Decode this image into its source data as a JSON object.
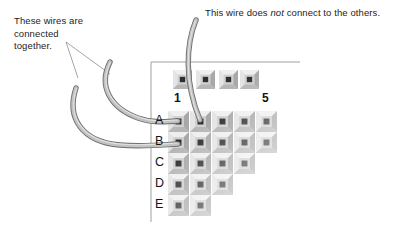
{
  "diagram": {
    "background_color": "#ffffff",
    "annotations": {
      "left": {
        "id": "left-callout",
        "text": "These wires are\nconnected\ntogether.",
        "lines": [
          "These wires are",
          "connected",
          "together."
        ],
        "color": "#1d1d1d"
      },
      "right": {
        "id": "right-callout",
        "text_before": "This wire does ",
        "emphasis": "not",
        "text_after": " connect to the others.",
        "full_text": "This wire does not connect to the others.",
        "color": "#1d1d1d"
      }
    },
    "board": {
      "name": "solderless-breadboard",
      "border_color": "#9a9a9a",
      "socket_face_color": "#d2d2d2",
      "socket_bevel_light": "#ebebeb",
      "socket_bevel_dark": "#9c9c9c",
      "socket_hole_color": "#2b2b2b",
      "bus_strip": {
        "label": "power-bus-strip",
        "socket_count": 4
      },
      "column_labels": [
        "1",
        "5"
      ],
      "column_label_positions": [
        1,
        5
      ],
      "row_labels": [
        "A",
        "B",
        "C",
        "D",
        "E"
      ],
      "row_socket_counts": [
        5,
        5,
        4,
        3,
        1
      ],
      "rows_obscured_by_wire": [
        "B"
      ]
    },
    "wires": [
      {
        "name": "wire-to-a1",
        "color": "#b4b4b4",
        "outline_color": "#6e6e6e",
        "connects_to": "A1",
        "group": "connected-together"
      },
      {
        "name": "wire-to-b1",
        "color": "#b4b4b4",
        "outline_color": "#6e6e6e",
        "connects_to": "B1",
        "group": "connected-together"
      },
      {
        "name": "wire-to-a2-isolated",
        "color": "#b4b4b4",
        "outline_color": "#6e6e6e",
        "connects_to": "A2",
        "group": "not-connected"
      }
    ],
    "leader_lines": {
      "name": "callout-leader-lines",
      "color": "#8a8a8a",
      "count": 2
    }
  }
}
